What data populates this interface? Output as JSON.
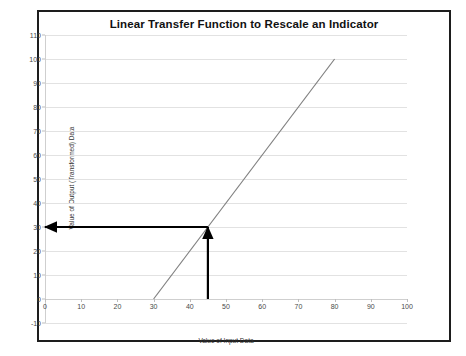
{
  "top_strip": {
    "text": "· ·        ·"
  },
  "chart_data": {
    "type": "line",
    "title": "Linear Transfer Function to Rescale an Indicator",
    "xlabel": "Value of Input Data",
    "ylabel": "Value of Output (Transformed) Data",
    "xlim": [
      0,
      100
    ],
    "ylim": [
      -10,
      110
    ],
    "xticks": [
      0,
      10,
      20,
      30,
      40,
      50,
      60,
      70,
      80,
      90,
      100
    ],
    "xtick_labels": [
      "0",
      "10",
      "20",
      "30",
      "40",
      "50",
      "60",
      "70",
      "80",
      "90",
      "100"
    ],
    "yticks": [
      -10,
      0,
      10,
      20,
      30,
      40,
      50,
      60,
      70,
      80,
      90,
      100,
      110
    ],
    "ytick_labels": [
      "-10",
      "0",
      "10",
      "20",
      "30",
      "40",
      "50",
      "60",
      "70",
      "80",
      "90",
      "100",
      "110"
    ],
    "grid": true,
    "legend": false,
    "series": [
      {
        "name": "Linear transfer function",
        "color": "#808080",
        "x": [
          30,
          80
        ],
        "values": [
          0,
          100
        ]
      }
    ],
    "annotations": [
      {
        "name": "input-arrow",
        "type": "arrow",
        "color": "#000000",
        "from_x": 45,
        "from_y": 0,
        "to_x": 45,
        "to_y": 30,
        "direction": "up"
      },
      {
        "name": "output-arrow",
        "type": "arrow",
        "color": "#000000",
        "from_x": 45,
        "from_y": 30,
        "to_x": 0,
        "to_y": 30,
        "direction": "left"
      }
    ],
    "colors": {
      "line": "#808080",
      "grid": "#e2e2e2",
      "axis": "#cfcfcf",
      "annotation": "#000000",
      "frame": "#1d1d1d",
      "text": "#333333",
      "title": "#111111"
    }
  }
}
